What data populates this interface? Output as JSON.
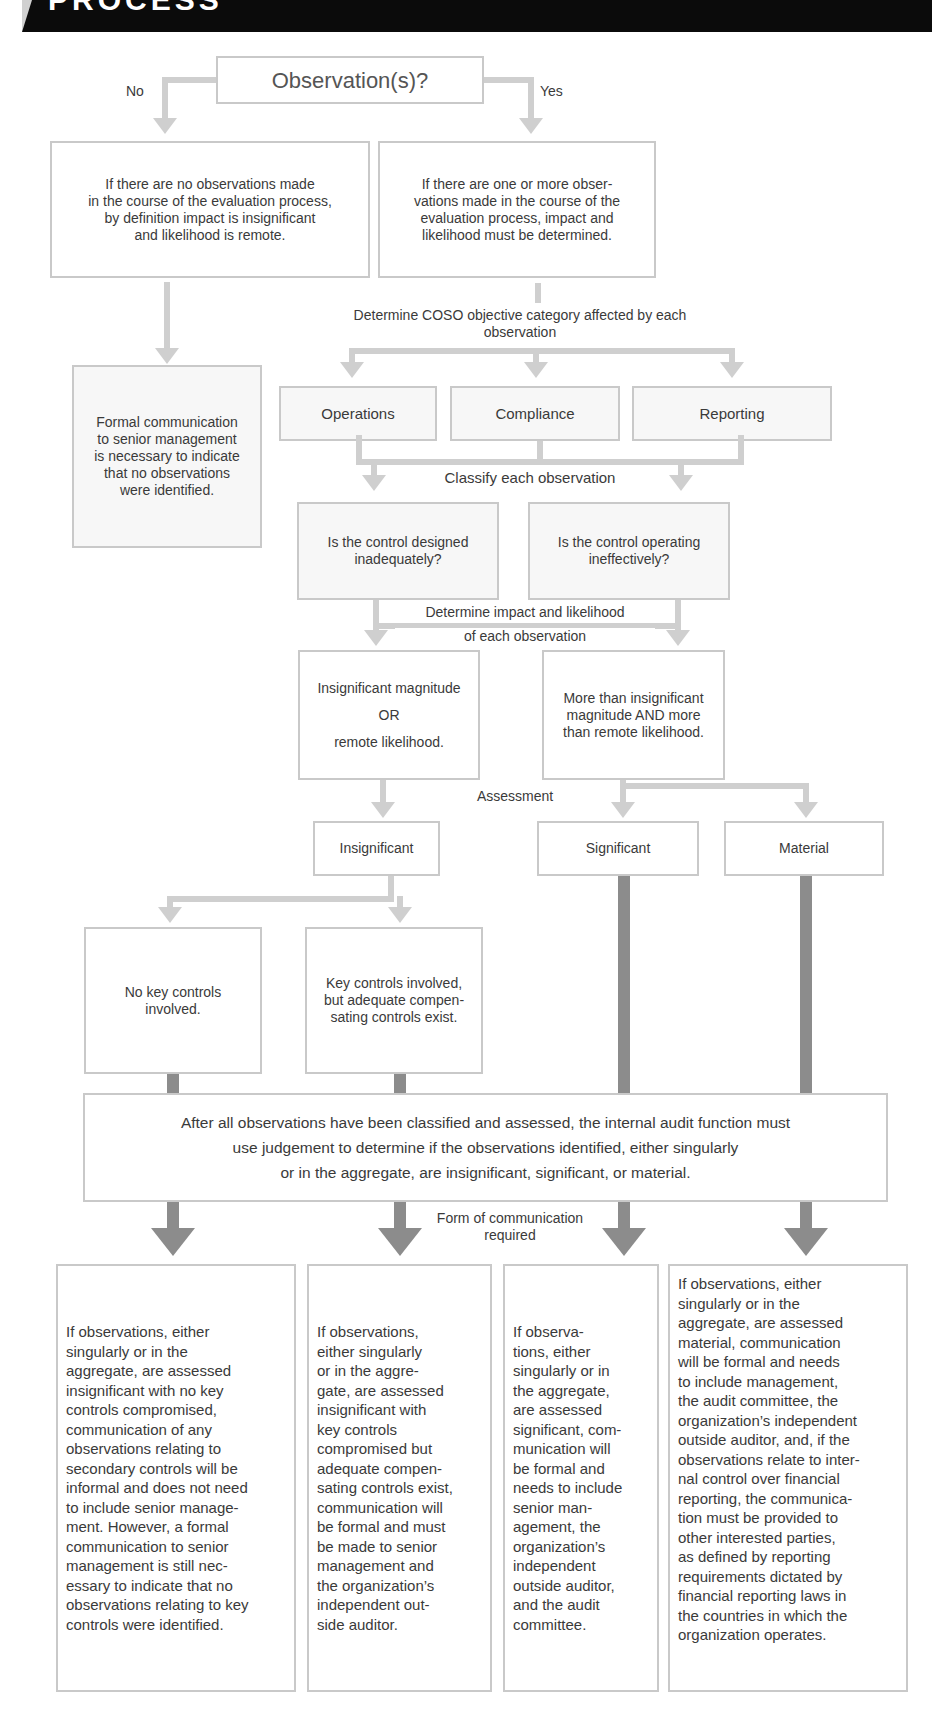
{
  "header": {
    "title": "PROCESS"
  },
  "decision": {
    "label": "Observation(s)?",
    "no_label": "No",
    "yes_label": "Yes"
  },
  "no_branch": {
    "text": "If there are no observations made\nin the course of the evaluation process,\nby definition impact is insignificant\nand likelihood is remote.",
    "formal_comm": "Formal communication\nto senior management\nis necessary to indicate\nthat no observations\nwere identified."
  },
  "yes_branch": {
    "text": "If there are one or more obser-\nvations made in the course of the\nevaluation process, impact and\nlikelihood must be determined."
  },
  "coso": {
    "label": "Determine COSO objective category affected by each\nobservation",
    "categories": [
      "Operations",
      "Compliance",
      "Reporting"
    ]
  },
  "classify": {
    "label": "Classify each observation",
    "questions": [
      "Is the control designed\ninadequately?",
      "Is the control operating\nineffectively?"
    ]
  },
  "impact": {
    "label_line1": "Determine impact and likelihood",
    "label_line2": "of each observation",
    "low": {
      "line1": "Insignificant magnitude",
      "line2": "OR",
      "line3": "remote likelihood."
    },
    "high": "More than insignificant\nmagnitude AND more\nthan remote likelihood."
  },
  "assessment": {
    "label": "Assessment",
    "levels": [
      "Insignificant",
      "Significant",
      "Material"
    ]
  },
  "key_controls": {
    "none": "No key controls\ninvolved.",
    "compensating": "Key controls involved,\nbut adequate compen-\nsating controls exist."
  },
  "aggregate": {
    "line1": "After all observations have been classified and assessed, the internal audit function must",
    "line2": "use judgement to determine if the observations identified, either singularly",
    "line3": "or in the aggregate, are insignificant, significant, or material."
  },
  "communication": {
    "label": "Form of communication\nrequired",
    "outcomes": [
      "If observations, either\nsingularly or in the\naggregate, are assessed\ninsignificant with no key\ncontrols compromised,\ncommunication of any\nobservations relating to\nsecondary controls will be\ninformal and does not need\nto include senior manage-\nment. However, a formal\ncommunication to senior\nmanagement is still nec-\nessary to indicate that no\nobservations relating to key\ncontrols were identified.",
      "If observations,\neither singularly\nor in the aggre-\ngate, are assessed\ninsignificant  with\nkey controls\ncompromised but\nadequate compen-\nsating controls exist,\ncommunication will\nbe formal and must\nbe made to senior\nmanagement and\nthe organization’s\nindependent  out-\nside auditor.",
      "If observa-\ntions, either\nsingularly or in\nthe aggregate,\nare assessed\nsignificant, com-\nmunication will\nbe formal and\nneeds to include\nsenior man-\nagement, the\norganization’s\nindependent\noutside auditor,\nand the audit\ncommittee.",
      "If observations, either\nsingularly or in the\naggregate, are assessed\nmaterial, communication\nwill be formal and needs\nto include management,\nthe audit committee, the\norganization’s independent\noutside auditor, and, if the\nobservations relate to inter-\nnal control over financial\nreporting, the communica-\ntion must be provided to\nother interested parties,\nas defined by reporting\nrequirements dictated by\nfinancial reporting laws in\nthe countries in which the\norganization operates."
    ]
  }
}
